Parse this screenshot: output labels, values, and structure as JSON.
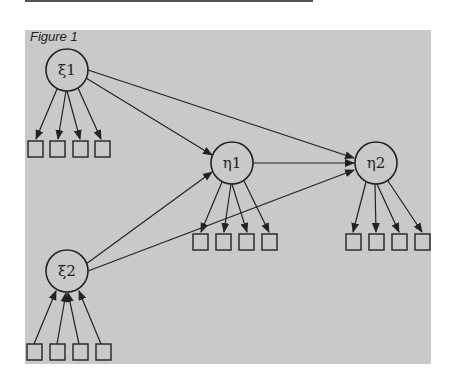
{
  "figure": {
    "title": "Figure 1",
    "background": "#c9c9c9",
    "stroke": "#222222"
  },
  "nodes": {
    "xi1": {
      "label": "ξ1"
    },
    "xi2": {
      "label": "ξ2"
    },
    "eta1": {
      "label": "η1"
    },
    "eta2": {
      "label": "η2"
    }
  },
  "indicators_per_latent": 4,
  "paths": [
    {
      "from": "ξ1",
      "to": "η1"
    },
    {
      "from": "ξ1",
      "to": "η2"
    },
    {
      "from": "ξ2",
      "to": "η1"
    },
    {
      "from": "ξ2",
      "to": "η2"
    },
    {
      "from": "η1",
      "to": "η2"
    }
  ]
}
